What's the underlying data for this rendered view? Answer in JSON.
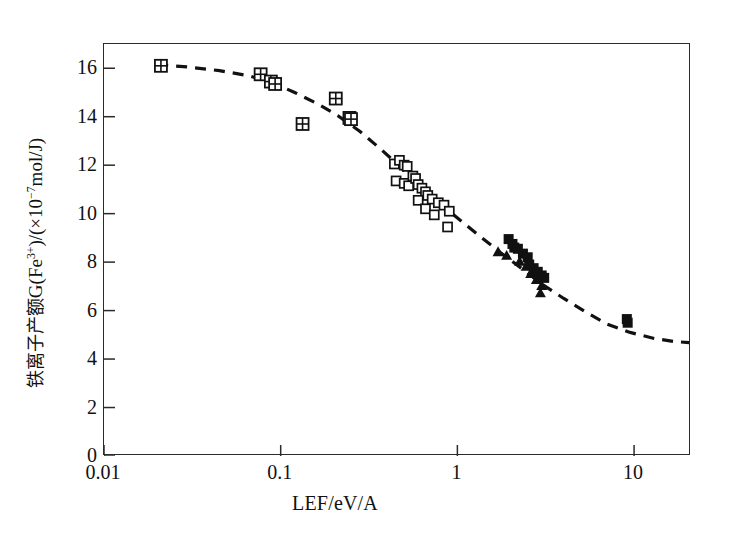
{
  "figure": {
    "background": "#ffffff",
    "axis_color": "#2b2b2b",
    "marker_color": "#111111"
  },
  "axes": {
    "x_title": "LEF/eV/A",
    "y_title_cjk": "铁离子产额",
    "y_title_latin_pre": "G(Fe",
    "y_title_sup1": "3+",
    "y_title_mid": ")/(×10",
    "y_title_sup2": "−7",
    "y_title_post": "mol/J)",
    "x_tick_labels": [
      "0.01",
      "0.1",
      "1",
      "10"
    ],
    "y_tick_labels": [
      "0",
      "2",
      "4",
      "6",
      "8",
      "10",
      "12",
      "14",
      "16"
    ]
  },
  "chart_data": {
    "type": "scatter",
    "title": "",
    "subtitle": "",
    "xlabel": "LEF/eV/A",
    "ylabel": "铁离子产额G(Fe3+)/(×10−7mol/J)",
    "xscale": "log",
    "yscale": "linear",
    "xlim": [
      0.01,
      21.0
    ],
    "ylim": [
      0,
      17.0
    ],
    "xticks": [
      0.01,
      0.1,
      1,
      10
    ],
    "yticks": [
      0,
      2,
      4,
      6,
      8,
      10,
      12,
      14,
      16
    ],
    "grid": false,
    "legend": "none",
    "annotations": [],
    "series": [
      {
        "name": "crossed-square",
        "marker": "crossed-square",
        "filled": false,
        "points": [
          [
            0.021,
            16.1
          ],
          [
            0.077,
            15.75
          ],
          [
            0.088,
            15.45
          ],
          [
            0.093,
            15.35
          ],
          [
            0.133,
            13.7
          ],
          [
            0.205,
            14.75
          ],
          [
            0.245,
            13.95
          ],
          [
            0.25,
            13.9
          ]
        ]
      },
      {
        "name": "open-square",
        "marker": "open-square",
        "filled": false,
        "points": [
          [
            0.44,
            12.05
          ],
          [
            0.47,
            12.2
          ],
          [
            0.5,
            12.0
          ],
          [
            0.52,
            11.95
          ],
          [
            0.45,
            11.35
          ],
          [
            0.5,
            11.25
          ],
          [
            0.53,
            11.15
          ],
          [
            0.56,
            11.55
          ],
          [
            0.58,
            11.45
          ],
          [
            0.6,
            11.2
          ],
          [
            0.63,
            11.05
          ],
          [
            0.66,
            10.9
          ],
          [
            0.6,
            10.55
          ],
          [
            0.68,
            10.75
          ],
          [
            0.72,
            10.6
          ],
          [
            0.66,
            10.2
          ],
          [
            0.78,
            10.45
          ],
          [
            0.84,
            10.35
          ],
          [
            0.74,
            9.95
          ],
          [
            0.9,
            10.1
          ],
          [
            0.88,
            9.45
          ]
        ]
      },
      {
        "name": "filled-square",
        "marker": "filled-square",
        "filled": true,
        "points": [
          [
            1.95,
            8.95
          ],
          [
            2.05,
            8.75
          ],
          [
            2.1,
            8.6
          ],
          [
            2.2,
            8.55
          ],
          [
            2.35,
            8.35
          ],
          [
            2.5,
            8.2
          ],
          [
            2.55,
            7.9
          ],
          [
            2.7,
            7.75
          ],
          [
            2.85,
            7.6
          ],
          [
            3.0,
            7.45
          ],
          [
            3.1,
            7.35
          ],
          [
            9.1,
            5.65
          ],
          [
            9.2,
            5.5
          ]
        ]
      },
      {
        "name": "filled-triangle",
        "marker": "filled-triangle",
        "filled": true,
        "points": [
          [
            1.7,
            8.45
          ],
          [
            1.9,
            8.3
          ],
          [
            2.25,
            8.05
          ],
          [
            2.45,
            7.85
          ],
          [
            2.6,
            7.55
          ],
          [
            2.8,
            7.3
          ],
          [
            3.0,
            7.05
          ],
          [
            2.95,
            6.75
          ]
        ]
      },
      {
        "name": "fitted-curve",
        "marker": "none",
        "style": "dashed",
        "points": [
          [
            0.02,
            16.15
          ],
          [
            0.03,
            16.05
          ],
          [
            0.045,
            15.9
          ],
          [
            0.065,
            15.7
          ],
          [
            0.09,
            15.4
          ],
          [
            0.12,
            15.0
          ],
          [
            0.16,
            14.55
          ],
          [
            0.21,
            14.05
          ],
          [
            0.28,
            13.4
          ],
          [
            0.37,
            12.65
          ],
          [
            0.48,
            11.9
          ],
          [
            0.62,
            11.15
          ],
          [
            0.8,
            10.4
          ],
          [
            1.05,
            9.7
          ],
          [
            1.35,
            9.05
          ],
          [
            1.75,
            8.4
          ],
          [
            2.3,
            7.75
          ],
          [
            3.0,
            7.1
          ],
          [
            4.0,
            6.5
          ],
          [
            5.3,
            5.95
          ],
          [
            7.0,
            5.45
          ],
          [
            9.5,
            5.1
          ],
          [
            13.0,
            4.85
          ],
          [
            17.0,
            4.72
          ],
          [
            20.5,
            4.68
          ]
        ]
      }
    ]
  }
}
